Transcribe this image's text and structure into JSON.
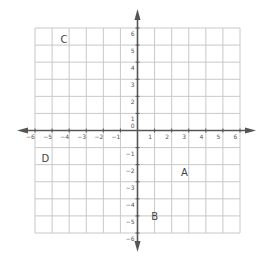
{
  "diagram": {
    "type": "coordinate-plane",
    "x_range": [
      -6,
      6
    ],
    "y_range": [
      -6,
      6
    ],
    "grid_step": 1,
    "grid_color": "#c8c8c8",
    "axis_color": "#555555",
    "x_tick_labels": [
      "-6",
      "-5",
      "-4",
      "-3",
      "-2",
      "-1",
      "1",
      "2",
      "3",
      "4",
      "5",
      "6"
    ],
    "y_tick_labels": [
      "6",
      "5",
      "4",
      "3",
      "2",
      "1",
      "0",
      "-1",
      "-2",
      "-3",
      "-4",
      "-5",
      "-6"
    ],
    "origin_label": "0",
    "points": [
      {
        "label": "A",
        "x": 2.75,
        "y": -2.45
      },
      {
        "label": "B",
        "x": 1.0,
        "y": -5.0
      },
      {
        "label": "C",
        "x": -4.3,
        "y": 5.35
      },
      {
        "label": "D",
        "x": -5.4,
        "y": -1.6
      }
    ]
  }
}
